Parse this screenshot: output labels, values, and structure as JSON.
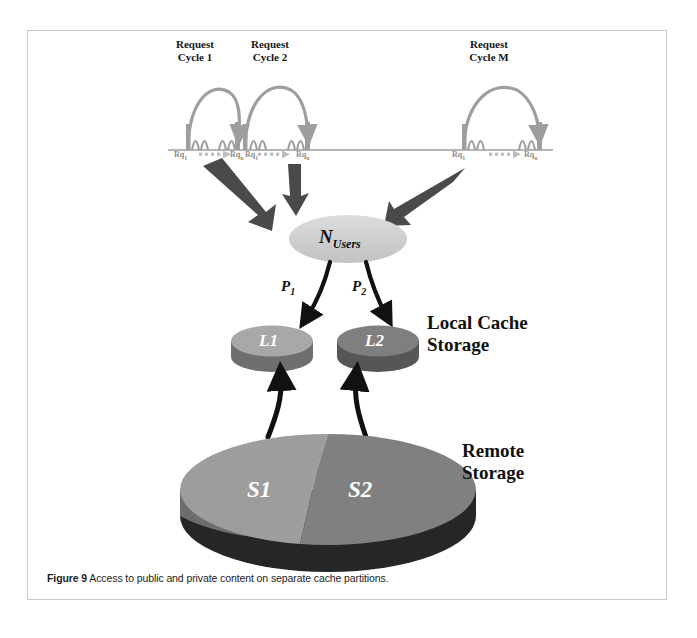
{
  "figure": {
    "caption_label": "Figure 9",
    "caption_text": "Access to public and private content on separate cache partitions.",
    "border_color": "#c9c9c9",
    "background": "#ffffff"
  },
  "timeline": {
    "baseline_color": "#9e9e9e",
    "wave_color": "#9e9e9e",
    "cycles": [
      {
        "id": "cycle-1",
        "title": "Request\nCycle 1",
        "start_label": "Rq",
        "start_sub": "1",
        "end_label": "Rq",
        "end_sub": "n"
      },
      {
        "id": "cycle-2",
        "title": "Request\nCycle 2",
        "start_label": "Rq",
        "start_sub": "1",
        "end_label": "Rq",
        "end_sub": "n"
      },
      {
        "id": "cycle-m",
        "title": "Request\nCycle M",
        "start_label": "Rq",
        "start_sub": "1",
        "end_label": "Rq",
        "end_sub": "n"
      }
    ]
  },
  "flow": {
    "feed_arrow_color": "#4a4a4a",
    "feed_arrow_count": 3,
    "users_node": {
      "label": "N",
      "sublabel": "Users",
      "fill": "#cfcfcf"
    },
    "probabilities": [
      {
        "id": "p1",
        "label": "P",
        "sub": "1"
      },
      {
        "id": "p2",
        "label": "P",
        "sub": "2"
      }
    ]
  },
  "local_cache": {
    "title": "Local Cache\nStorage",
    "nodes": [
      {
        "id": "l1",
        "label": "L1",
        "top_fill": "#a8a8a8",
        "side_fill": "#6f6f6f"
      },
      {
        "id": "l2",
        "label": "L2",
        "top_fill": "#7f7f7f",
        "side_fill": "#565656"
      }
    ]
  },
  "remote_storage": {
    "title": "Remote\nStorage",
    "sectors": [
      {
        "id": "s1",
        "label": "S1",
        "fill": "#9d9d9d",
        "side_fill": "#6d6d6d"
      },
      {
        "id": "s2",
        "label": "S2",
        "fill": "#808080",
        "side_fill": "#262626"
      }
    ]
  },
  "colors": {
    "wave_gray": "#9e9e9e",
    "arrow_dark": "#4a4a4a",
    "black_arrow": "#111111",
    "text": "#151515"
  }
}
